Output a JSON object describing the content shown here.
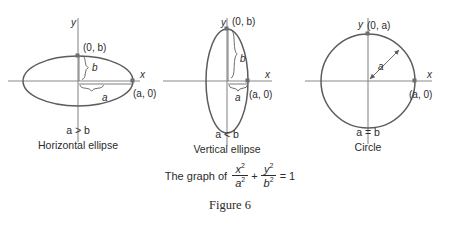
{
  "figure": {
    "caption": "Figure 6",
    "equation": {
      "prefix": "The graph of",
      "term1_num": "x2",
      "term1_den": "a2",
      "plus": "+",
      "term2_num": "y2",
      "term2_den": "b2",
      "equals": "= 1"
    }
  },
  "panels": [
    {
      "id": "horizontal-ellipse",
      "axis_x_label": "x",
      "axis_y_label": "y",
      "point_top": "(0, b)",
      "point_right": "(a, 0)",
      "semi_minor_label": "b",
      "semi_major_label": "a",
      "condition": "a > b",
      "name": "Horizontal ellipse"
    },
    {
      "id": "vertical-ellipse",
      "axis_x_label": "x",
      "axis_y_label": "y",
      "point_top": "(0, b)",
      "point_right": "(a, 0)",
      "semi_minor_label": "b",
      "semi_major_label": "a",
      "condition": "a < b",
      "name": "Vertical ellipse"
    },
    {
      "id": "circle",
      "axis_x_label": "x",
      "axis_y_label": "y",
      "point_top": "(0, a)",
      "point_right": "(a, 0)",
      "radius_label": "a",
      "condition": "a = b",
      "name": "Circle"
    }
  ],
  "colors": {
    "curve": "#5c5c5c",
    "axis": "#8a8a8a",
    "text": "#2b2b2b",
    "background": "#ffffff"
  }
}
